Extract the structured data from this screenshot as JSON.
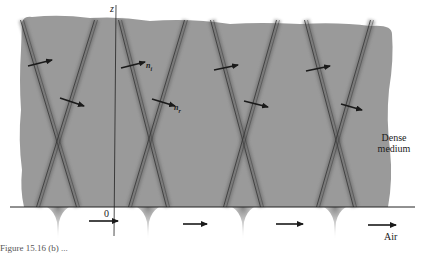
{
  "figure": {
    "type": "physics-diagram",
    "colors": {
      "dense_medium_fill": "#9a9a9a",
      "wavefront": "#333333",
      "arrow": "#1a1a1a",
      "interface_line": "#222222",
      "background": "#ffffff"
    },
    "axes": {
      "z_label": "z",
      "origin_label": "0"
    },
    "labels": {
      "incident_normal": "n",
      "incident_sub": "i",
      "reflected_normal": "n",
      "reflected_sub": "r",
      "dense_medium_line1": "Dense",
      "dense_medium_line2": "medium",
      "air": "Air"
    },
    "wavefront_crossings": [
      {
        "top_left": 22,
        "top_right": 96,
        "bottom_left": 38,
        "bottom_right": 78
      },
      {
        "top_left": 120,
        "top_right": 186,
        "bottom_left": 130,
        "bottom_right": 168
      },
      {
        "top_left": 212,
        "top_right": 278,
        "bottom_left": 225,
        "bottom_right": 262
      },
      {
        "top_left": 306,
        "top_right": 372,
        "bottom_left": 318,
        "bottom_right": 355
      }
    ],
    "incident_arrows": [
      {
        "x1": 28,
        "y1": 66,
        "x2": 52,
        "y2": 60
      },
      {
        "x1": 121,
        "y1": 68,
        "x2": 145,
        "y2": 62
      },
      {
        "x1": 214,
        "y1": 70,
        "x2": 238,
        "y2": 65
      },
      {
        "x1": 306,
        "y1": 71,
        "x2": 330,
        "y2": 66
      }
    ],
    "reflected_arrows": [
      {
        "x1": 60,
        "y1": 98,
        "x2": 84,
        "y2": 106
      },
      {
        "x1": 152,
        "y1": 99,
        "x2": 175,
        "y2": 106
      },
      {
        "x1": 244,
        "y1": 101,
        "x2": 268,
        "y2": 107
      },
      {
        "x1": 341,
        "y1": 104,
        "x2": 362,
        "y2": 110
      }
    ],
    "evanescent_drips_x": [
      58,
      148,
      243,
      335
    ],
    "air_arrows": [
      {
        "x1": 89,
        "y1": 221,
        "x2": 118,
        "y2": 221
      },
      {
        "x1": 183,
        "y1": 224,
        "x2": 207,
        "y2": 224
      },
      {
        "x1": 276,
        "y1": 224,
        "x2": 303,
        "y2": 224
      },
      {
        "x1": 368,
        "y1": 225,
        "x2": 396,
        "y2": 225
      }
    ],
    "caption": "Figure 15.16 (b) ..."
  }
}
